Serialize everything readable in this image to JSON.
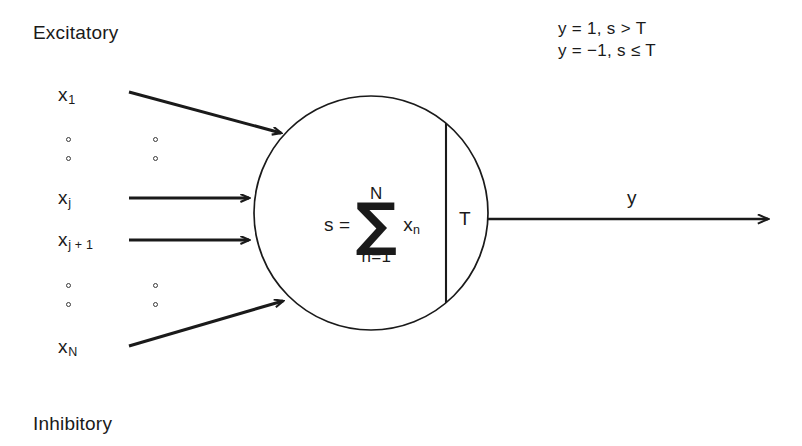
{
  "diagram": {
    "region_labels": {
      "top": "Excitatory",
      "bottom": "Inhibitory"
    },
    "inputs": [
      {
        "name": "x1",
        "label": "x",
        "subscript": "1"
      },
      {
        "name": "xj",
        "label": "x",
        "subscript": "j"
      },
      {
        "name": "xj1",
        "label": "x",
        "subscript": "j + 1"
      },
      {
        "name": "xN",
        "label": "x",
        "subscript": "N"
      }
    ],
    "soma": {
      "lhs": "s =",
      "sigma": "∑",
      "upper_limit": "N",
      "lower_limit": "n=1",
      "term": "x",
      "term_subscript": "n",
      "threshold": "T"
    },
    "output": {
      "label": "y"
    },
    "equations": [
      "y = 1, s > T",
      "y = −1, s ≤ T"
    ],
    "colors": {
      "background": "#ffffff",
      "stroke": "#1a1a1a",
      "text": "#1a1a1a"
    }
  }
}
